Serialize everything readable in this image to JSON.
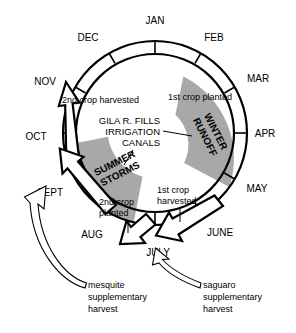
{
  "diagram": {
    "colors": {
      "season_fill": "#a8a8a8",
      "stroke": "#000000",
      "background": "#ffffff",
      "arrow_fill": "#ffffff"
    },
    "months": [
      {
        "key": "jan",
        "label": "JAN",
        "x": 155,
        "y": 24,
        "anchor": "middle",
        "tick_angle": -90
      },
      {
        "key": "feb",
        "label": "FEB",
        "x": 215,
        "y": 40,
        "anchor": "middle",
        "tick_angle": -60
      },
      {
        "key": "mar",
        "label": "MAR",
        "x": 258,
        "y": 82,
        "anchor": "middle",
        "tick_angle": -30
      },
      {
        "key": "apr",
        "label": "APR",
        "x": 268,
        "y": 137,
        "anchor": "middle",
        "tick_angle": 0
      },
      {
        "key": "may",
        "label": "MAY",
        "x": 258,
        "y": 192,
        "anchor": "middle",
        "tick_angle": 30
      },
      {
        "key": "june",
        "label": "JUNE",
        "x": 219,
        "y": 235,
        "anchor": "middle",
        "tick_angle": 60
      },
      {
        "key": "july",
        "label": "JULY",
        "x": 158,
        "y": 255,
        "anchor": "middle",
        "tick_angle": 90
      },
      {
        "key": "aug",
        "label": "AUG",
        "x": 93,
        "y": 237,
        "anchor": "middle",
        "tick_angle": 120
      },
      {
        "key": "sept",
        "label": "SEPT",
        "x": 51,
        "y": 195,
        "anchor": "middle",
        "tick_angle": 150
      },
      {
        "key": "oct",
        "label": "OCT",
        "x": 37,
        "y": 140,
        "anchor": "middle",
        "tick_angle": 180
      },
      {
        "key": "nov",
        "label": "NOV",
        "x": 46,
        "y": 83,
        "anchor": "middle",
        "tick_angle": -150
      },
      {
        "key": "dec",
        "label": "DEC",
        "x": 88,
        "y": 40,
        "anchor": "middle",
        "tick_angle": -120
      }
    ],
    "seasons": [
      {
        "key": "winter-runoff",
        "label": "WINTER RUNOFF",
        "line1": "WINTER",
        "line2": "RUNOFF",
        "start_angle": -38,
        "end_angle": 36,
        "rotation": 63
      },
      {
        "key": "summer-storms",
        "label": "SUMMER STORMS",
        "line1": "SUMMER",
        "line2": "STORMS",
        "start_angle": 104,
        "end_angle": 172,
        "rotation": -27
      }
    ],
    "center_note": {
      "key": "gila-river-note",
      "lines": [
        "GILA R. FILLS",
        "IRRIGATION",
        "CANALS"
      ]
    },
    "annotations": [
      {
        "key": "first-crop-planted",
        "label": "1st crop planted",
        "x": 168,
        "y": 97,
        "anchor": "start"
      },
      {
        "key": "second-crop-harvested",
        "label": "2nd crop harvested",
        "x": 62,
        "y": 101,
        "anchor": "start"
      },
      {
        "key": "second-crop-planted",
        "lines": [
          "2nd crop",
          "planted"
        ],
        "x": 100,
        "y": 204,
        "anchor": "start"
      },
      {
        "key": "first-crop-harvested",
        "lines": [
          "1st crop",
          "harvested"
        ],
        "x": 158,
        "y": 192,
        "anchor": "start"
      }
    ],
    "footnotes": [
      {
        "key": "mesquite-harvest",
        "lines": [
          "mesquite",
          "supplementary",
          "harvest"
        ],
        "x": 88,
        "y": 286
      },
      {
        "key": "saguaro-harvest",
        "lines": [
          "saguaro",
          "supplementary",
          "harvest"
        ],
        "x": 203,
        "y": 286
      }
    ]
  }
}
